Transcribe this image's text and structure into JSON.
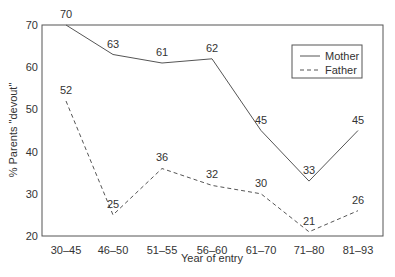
{
  "chart_data": {
    "type": "line",
    "title": "",
    "xlabel": "Year of entry",
    "ylabel": "% Parents \"devout\"",
    "categories": [
      "30–45",
      "46–50",
      "51–55",
      "56–60",
      "61–70",
      "71–80",
      "81–93"
    ],
    "series": [
      {
        "name": "Mother",
        "style": "solid",
        "values": [
          70,
          63,
          61,
          62,
          45,
          33,
          45
        ]
      },
      {
        "name": "Father",
        "style": "dashed",
        "values": [
          52,
          25,
          36,
          32,
          30,
          21,
          26
        ]
      }
    ],
    "ylim": [
      20,
      70
    ],
    "yticks": [
      20,
      30,
      40,
      50,
      60,
      70
    ],
    "grid": false,
    "legend_position": "upper right",
    "data_labels": true
  },
  "colors": {
    "line": "#555555",
    "axis": "#555555",
    "text": "#333333"
  }
}
